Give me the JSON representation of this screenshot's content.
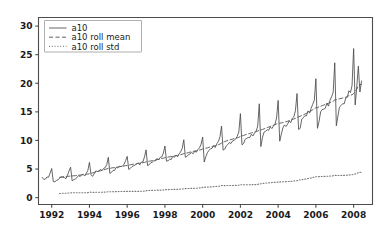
{
  "figure": {
    "background_color": "#ffffff",
    "axes_color": "#4d4d4d",
    "title": ""
  },
  "legend": {
    "position": "upper-left",
    "entries": [
      {
        "label": "a10",
        "style": "solid",
        "color": "#4a4a4a"
      },
      {
        "label": "a10 roll mean",
        "style": "dashed",
        "color": "#5a5a5a"
      },
      {
        "label": "a10 roll std",
        "style": "dotted",
        "color": "#7a7a7a"
      }
    ]
  },
  "axes": {
    "x_ticks": [
      "1992",
      "1994",
      "1996",
      "1998",
      "2000",
      "2002",
      "2004",
      "2006",
      "2008"
    ],
    "y_ticks": [
      "0",
      "5",
      "10",
      "15",
      "20",
      "25",
      "30"
    ]
  },
  "chart_data": {
    "type": "line",
    "title": "",
    "xlabel": "",
    "ylabel": "",
    "xlim": [
      1991.3,
      2009.0
    ],
    "ylim": [
      -1.2,
      31.5
    ],
    "grid": false,
    "legend_position": "upper left",
    "x_tick_values": [
      1992,
      1994,
      1996,
      1998,
      2000,
      2002,
      2004,
      2006,
      2008
    ],
    "y_tick_values": [
      0,
      5,
      10,
      15,
      20,
      25,
      30
    ],
    "x": [
      1991.5,
      1991.583,
      1991.667,
      1991.75,
      1991.833,
      1991.917,
      1992.0,
      1992.083,
      1992.167,
      1992.25,
      1992.333,
      1992.417,
      1992.5,
      1992.583,
      1992.667,
      1992.75,
      1992.833,
      1992.917,
      1993.0,
      1993.083,
      1993.167,
      1993.25,
      1993.333,
      1993.417,
      1993.5,
      1993.583,
      1993.667,
      1993.75,
      1993.833,
      1993.917,
      1994.0,
      1994.083,
      1994.167,
      1994.25,
      1994.333,
      1994.417,
      1994.5,
      1994.583,
      1994.667,
      1994.75,
      1994.833,
      1994.917,
      1995.0,
      1995.083,
      1995.167,
      1995.25,
      1995.333,
      1995.417,
      1995.5,
      1995.583,
      1995.667,
      1995.75,
      1995.833,
      1995.917,
      1996.0,
      1996.083,
      1996.167,
      1996.25,
      1996.333,
      1996.417,
      1996.5,
      1996.583,
      1996.667,
      1996.75,
      1996.833,
      1996.917,
      1997.0,
      1997.083,
      1997.167,
      1997.25,
      1997.333,
      1997.417,
      1997.5,
      1997.583,
      1997.667,
      1997.75,
      1997.833,
      1997.917,
      1998.0,
      1998.083,
      1998.167,
      1998.25,
      1998.333,
      1998.417,
      1998.5,
      1998.583,
      1998.667,
      1998.75,
      1998.833,
      1998.917,
      1999.0,
      1999.083,
      1999.167,
      1999.25,
      1999.333,
      1999.417,
      1999.5,
      1999.583,
      1999.667,
      1999.75,
      1999.833,
      1999.917,
      2000.0,
      2000.083,
      2000.167,
      2000.25,
      2000.333,
      2000.417,
      2000.5,
      2000.583,
      2000.667,
      2000.75,
      2000.833,
      2000.917,
      2001.0,
      2001.083,
      2001.167,
      2001.25,
      2001.333,
      2001.417,
      2001.5,
      2001.583,
      2001.667,
      2001.75,
      2001.833,
      2001.917,
      2002.0,
      2002.083,
      2002.167,
      2002.25,
      2002.333,
      2002.417,
      2002.5,
      2002.583,
      2002.667,
      2002.75,
      2002.833,
      2002.917,
      2003.0,
      2003.083,
      2003.167,
      2003.25,
      2003.333,
      2003.417,
      2003.5,
      2003.583,
      2003.667,
      2003.75,
      2003.833,
      2003.917,
      2004.0,
      2004.083,
      2004.167,
      2004.25,
      2004.333,
      2004.417,
      2004.5,
      2004.583,
      2004.667,
      2004.75,
      2004.833,
      2004.917,
      2005.0,
      2005.083,
      2005.167,
      2005.25,
      2005.333,
      2005.417,
      2005.5,
      2005.583,
      2005.667,
      2005.75,
      2005.833,
      2005.917,
      2006.0,
      2006.083,
      2006.167,
      2006.25,
      2006.333,
      2006.417,
      2006.5,
      2006.583,
      2006.667,
      2006.75,
      2006.833,
      2006.917,
      2007.0,
      2007.083,
      2007.167,
      2007.25,
      2007.333,
      2007.417,
      2007.5,
      2007.583,
      2007.667,
      2007.75,
      2007.833,
      2007.917,
      2008.0,
      2008.083,
      2008.167,
      2008.25,
      2008.333,
      2008.417
    ],
    "series": [
      {
        "name": "a10",
        "style": "solid",
        "color": "#4a4a4a",
        "values": [
          3.53,
          3.18,
          3.25,
          3.61,
          3.57,
          4.31,
          5.09,
          2.81,
          2.76,
          3.0,
          3.11,
          3.41,
          3.62,
          3.55,
          3.52,
          3.3,
          3.92,
          4.65,
          5.33,
          2.95,
          3.13,
          3.27,
          3.48,
          3.85,
          3.7,
          3.96,
          4.09,
          3.78,
          4.24,
          4.78,
          6.17,
          4.0,
          3.72,
          4.16,
          4.66,
          4.58,
          4.63,
          4.93,
          4.72,
          5.11,
          5.25,
          5.77,
          7.05,
          4.23,
          4.43,
          4.76,
          4.77,
          5.31,
          5.19,
          5.49,
          5.43,
          5.51,
          5.83,
          6.46,
          7.22,
          4.93,
          5.12,
          5.41,
          5.57,
          5.7,
          5.86,
          6.07,
          5.72,
          6.22,
          6.25,
          7.13,
          8.35,
          5.6,
          5.76,
          6.11,
          6.2,
          6.46,
          6.43,
          6.86,
          6.58,
          7.05,
          7.13,
          7.79,
          9.02,
          6.38,
          6.45,
          6.72,
          6.67,
          7.25,
          7.04,
          7.43,
          7.14,
          7.65,
          8.01,
          8.64,
          10.12,
          7.06,
          7.22,
          7.53,
          7.68,
          7.88,
          7.68,
          8.13,
          7.95,
          8.41,
          8.73,
          9.34,
          10.58,
          6.23,
          7.16,
          7.86,
          8.25,
          8.55,
          8.63,
          9.09,
          8.76,
          9.44,
          9.82,
          10.65,
          12.5,
          8.31,
          8.48,
          9.02,
          9.29,
          9.64,
          9.46,
          9.91,
          10.03,
          10.24,
          10.74,
          11.48,
          14.69,
          9.24,
          9.46,
          10.2,
          10.36,
          10.51,
          10.53,
          11.08,
          10.79,
          11.33,
          11.6,
          12.52,
          16.41,
          8.93,
          10.47,
          11.45,
          11.61,
          11.86,
          11.79,
          12.36,
          12.08,
          12.52,
          12.84,
          13.93,
          17.0,
          9.87,
          11.08,
          12.18,
          12.72,
          12.44,
          12.85,
          13.41,
          13.11,
          13.88,
          14.14,
          15.23,
          18.21,
          11.93,
          12.12,
          13.73,
          13.97,
          14.33,
          14.31,
          15.17,
          14.78,
          15.64,
          16.32,
          17.04,
          20.8,
          12.12,
          13.33,
          15.01,
          15.39,
          15.46,
          15.63,
          16.53,
          16.01,
          17.06,
          17.63,
          18.43,
          23.58,
          12.57,
          14.26,
          15.83,
          16.1,
          16.43,
          16.4,
          17.42,
          17.57,
          18.69,
          18.37,
          19.61,
          26.07,
          16.21,
          19.38,
          22.99,
          18.47,
          20.38
        ]
      },
      {
        "name": "a10 roll mean",
        "style": "dashed",
        "color": "#5a5a5a",
        "window": 12,
        "values": [
          null,
          null,
          null,
          null,
          null,
          null,
          null,
          null,
          null,
          null,
          null,
          3.55,
          3.6,
          3.66,
          3.68,
          3.65,
          3.72,
          3.75,
          3.77,
          3.79,
          3.82,
          3.84,
          3.89,
          3.93,
          3.94,
          3.98,
          4.03,
          4.07,
          4.1,
          4.11,
          4.18,
          4.27,
          4.32,
          4.39,
          4.49,
          4.55,
          4.63,
          4.71,
          4.76,
          4.87,
          4.95,
          5.03,
          5.1,
          5.12,
          5.18,
          5.23,
          5.24,
          5.3,
          5.35,
          5.4,
          5.46,
          5.49,
          5.54,
          5.6,
          5.62,
          5.68,
          5.74,
          5.79,
          5.86,
          5.89,
          5.95,
          6.0,
          6.02,
          6.08,
          6.11,
          6.16,
          6.25,
          6.31,
          6.36,
          6.42,
          6.47,
          6.53,
          6.58,
          6.64,
          6.71,
          6.78,
          6.85,
          6.91,
          6.97,
          7.03,
          7.09,
          7.14,
          7.18,
          7.25,
          7.3,
          7.35,
          7.4,
          7.45,
          7.53,
          7.6,
          7.69,
          7.75,
          7.81,
          7.88,
          7.96,
          8.02,
          8.08,
          8.14,
          8.21,
          8.27,
          8.33,
          8.39,
          8.52,
          8.59,
          8.64,
          8.7,
          8.8,
          8.86,
          8.94,
          9.02,
          9.09,
          9.17,
          9.26,
          9.37,
          9.53,
          9.7,
          9.81,
          9.91,
          10.0,
          10.09,
          10.16,
          10.23,
          10.33,
          10.39,
          10.47,
          10.54,
          10.72,
          10.8,
          10.88,
          10.98,
          11.07,
          11.14,
          11.23,
          11.33,
          11.39,
          11.48,
          11.55,
          11.64,
          11.78,
          11.84,
          11.92,
          12.03,
          12.13,
          12.24,
          12.35,
          12.46,
          12.57,
          12.67,
          12.77,
          12.89,
          12.94,
          13.02,
          13.07,
          13.13,
          13.22,
          13.27,
          13.36,
          13.45,
          13.54,
          13.65,
          13.76,
          13.87,
          13.97,
          14.14,
          14.23,
          14.36,
          14.46,
          14.62,
          14.74,
          14.89,
          15.03,
          15.18,
          15.37,
          15.52,
          15.74,
          15.76,
          15.86,
          15.97,
          16.09,
          16.19,
          16.3,
          16.41,
          16.51,
          16.63,
          16.74,
          16.86,
          17.09,
          17.13,
          17.21,
          17.28,
          17.34,
          17.42,
          17.48,
          17.56,
          17.69,
          17.83,
          17.89,
          17.99,
          18.2,
          18.53,
          18.96,
          19.56,
          19.75,
          19.82
        ]
      },
      {
        "name": "a10 roll std",
        "style": "dotted",
        "color": "#7a7a7a",
        "window": 12,
        "values": [
          null,
          null,
          null,
          null,
          null,
          null,
          null,
          null,
          null,
          null,
          null,
          0.72,
          0.74,
          0.77,
          0.78,
          0.77,
          0.8,
          0.82,
          0.85,
          0.84,
          0.85,
          0.85,
          0.85,
          0.86,
          0.85,
          0.85,
          0.86,
          0.86,
          0.86,
          0.88,
          0.97,
          0.95,
          0.93,
          0.93,
          0.95,
          0.94,
          0.94,
          0.95,
          0.95,
          0.97,
          0.97,
          0.98,
          1.05,
          1.03,
          1.03,
          1.04,
          1.03,
          1.05,
          1.06,
          1.07,
          1.08,
          1.07,
          1.08,
          1.11,
          1.1,
          1.1,
          1.1,
          1.1,
          1.11,
          1.1,
          1.1,
          1.11,
          1.1,
          1.12,
          1.11,
          1.15,
          1.22,
          1.23,
          1.25,
          1.27,
          1.28,
          1.29,
          1.29,
          1.3,
          1.31,
          1.32,
          1.33,
          1.35,
          1.38,
          1.4,
          1.41,
          1.42,
          1.42,
          1.44,
          1.44,
          1.45,
          1.45,
          1.46,
          1.49,
          1.51,
          1.56,
          1.57,
          1.58,
          1.6,
          1.62,
          1.63,
          1.63,
          1.64,
          1.65,
          1.67,
          1.69,
          1.72,
          1.79,
          1.83,
          1.84,
          1.85,
          1.87,
          1.88,
          1.9,
          1.92,
          1.93,
          1.96,
          1.99,
          2.03,
          2.12,
          2.11,
          2.11,
          2.12,
          2.12,
          2.13,
          2.13,
          2.13,
          2.15,
          2.15,
          2.16,
          2.18,
          2.26,
          2.25,
          2.24,
          2.25,
          2.25,
          2.25,
          2.26,
          2.27,
          2.27,
          2.28,
          2.29,
          2.31,
          2.41,
          2.42,
          2.47,
          2.52,
          2.55,
          2.57,
          2.59,
          2.62,
          2.64,
          2.66,
          2.68,
          2.71,
          2.71,
          2.75,
          2.75,
          2.77,
          2.79,
          2.79,
          2.81,
          2.83,
          2.85,
          2.88,
          2.91,
          2.94,
          2.96,
          3.07,
          3.09,
          3.15,
          3.18,
          3.24,
          3.28,
          3.34,
          3.39,
          3.45,
          3.53,
          3.58,
          3.66,
          3.66,
          3.67,
          3.69,
          3.7,
          3.71,
          3.72,
          3.74,
          3.75,
          3.78,
          3.8,
          3.83,
          3.89,
          3.88,
          3.88,
          3.88,
          3.88,
          3.89,
          3.89,
          3.9,
          3.93,
          3.97,
          3.98,
          4.01,
          4.07,
          4.13,
          4.22,
          4.38,
          4.42,
          4.45
        ]
      }
    ]
  }
}
